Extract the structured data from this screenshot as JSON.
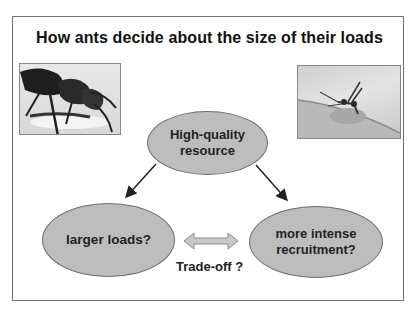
{
  "slide": {
    "title": "How ants decide about the size of their loads",
    "images": [
      {
        "name": "ant-carrying-load-photo",
        "description": "close-up of ant"
      },
      {
        "name": "ant-recruitment-photo",
        "description": "ant on leaf"
      }
    ],
    "nodes": {
      "top": {
        "line1": "High-quality",
        "line2": "resource"
      },
      "left": {
        "line1": "larger loads?"
      },
      "right": {
        "line1": "more intense",
        "line2": "recruitment?"
      }
    },
    "tradeoff_label": "Trade-off ?",
    "colors": {
      "ellipse_fill": "#bdbdbd",
      "ellipse_border": "#6d6d6d",
      "arrow": "#222222",
      "double_arrow_fill": "#c8c8c8"
    }
  }
}
